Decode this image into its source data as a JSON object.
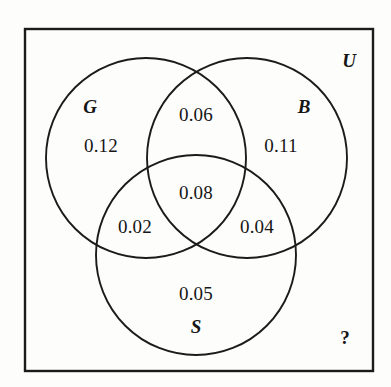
{
  "diagram": {
    "type": "venn-3-set",
    "title": "",
    "universe_label": "U",
    "unknown_marker": "?",
    "sets": [
      {
        "id": "G",
        "label": "G",
        "label_x": 90,
        "label_y": 106
      },
      {
        "id": "B",
        "label": "B",
        "label_y": 106,
        "label_x": 304
      },
      {
        "id": "S",
        "label": "S",
        "label_x": 196,
        "label_y": 326
      }
    ],
    "regions": [
      {
        "id": "G-only",
        "label": "0.12",
        "value": 0.12,
        "x": 101,
        "y": 145
      },
      {
        "id": "B-only",
        "label": "0.11",
        "value": 0.11,
        "x": 281,
        "y": 145
      },
      {
        "id": "G-and-B",
        "label": "0.06",
        "value": 0.06,
        "x": 196,
        "y": 114
      },
      {
        "id": "G-B-S",
        "label": "0.08",
        "value": 0.08,
        "x": 196,
        "y": 192
      },
      {
        "id": "G-and-S",
        "label": "0.02",
        "value": 0.02,
        "x": 135,
        "y": 226
      },
      {
        "id": "B-and-S",
        "label": "0.04",
        "value": 0.04,
        "x": 257,
        "y": 226
      },
      {
        "id": "S-only",
        "label": "0.05",
        "value": 0.05,
        "x": 196,
        "y": 293
      },
      {
        "id": "outside",
        "label": "?",
        "value": null,
        "x": 345,
        "y": 337
      }
    ],
    "universe": {
      "x": 349,
      "y": 60
    },
    "geometry": {
      "box": {
        "x": 25,
        "y": 29,
        "width": 348,
        "height": 342
      },
      "circles": [
        {
          "id": "G",
          "cx": 146,
          "cy": 158,
          "r": 100
        },
        {
          "id": "B",
          "cx": 247,
          "cy": 158,
          "r": 100
        },
        {
          "id": "S",
          "cx": 196,
          "cy": 255,
          "r": 100
        }
      ]
    },
    "colors": {
      "stroke": "#1b1b1b",
      "background": "#fdfdfc",
      "text": "#161616"
    }
  }
}
